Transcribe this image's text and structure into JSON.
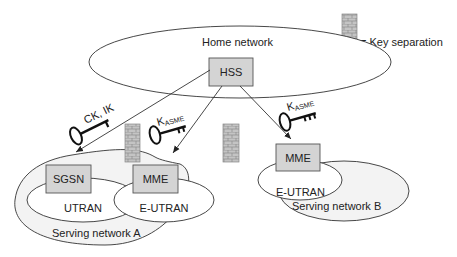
{
  "legend": {
    "symbol": "brick-wall-icon",
    "label": "= Key separation"
  },
  "home_network": {
    "label": "Home network",
    "node": "HSS"
  },
  "serving_network_a": {
    "label": "Serving network A",
    "nodes": [
      {
        "name": "SGSN",
        "access": "UTRAN"
      },
      {
        "name": "MME",
        "access": "E-UTRAN"
      }
    ]
  },
  "serving_network_b": {
    "label": "Serving network B",
    "nodes": [
      {
        "name": "MME",
        "access": "E-UTRAN"
      }
    ]
  },
  "keys": [
    {
      "label": "CK, IK",
      "main": "CK, IK",
      "sub": "",
      "target": "SGSN"
    },
    {
      "label": "KASME",
      "main": "K",
      "sub": "ASME",
      "target": "MME (A)"
    },
    {
      "label": "KASME",
      "main": "K",
      "sub": "ASME",
      "target": "MME (B)"
    }
  ],
  "colors": {
    "box_fill": "#d4d4d4",
    "box_stroke": "#555555",
    "wall_fill": "#b8b8b8",
    "line": "#333333"
  }
}
